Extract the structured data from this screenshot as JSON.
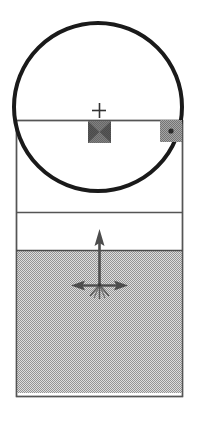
{
  "viewport": {
    "name": "CAD Sketch Viewport",
    "width": 206,
    "height": 443,
    "background_color": "#ffffff"
  },
  "colors": {
    "outline": "#1a1a1a",
    "edge_line": "#555555",
    "fill_grey": "#b3b3b3",
    "fill_white": "#ffffff",
    "handle_grey": "#808080",
    "gizmo": "#4d4d4d",
    "marker": "#333333"
  },
  "geometry": {
    "body_rect": {
      "label": "Extruded Body",
      "x": 16,
      "y": 120,
      "width": 167,
      "height": 277,
      "stroke": "#555555",
      "fill": "#ffffff"
    },
    "divider_lines": [
      {
        "label": "Upper Edge Line",
        "y": 212,
        "x1": 16,
        "x2": 183
      },
      {
        "label": "Material Boundary Line",
        "y": 250,
        "x1": 16,
        "x2": 183
      }
    ],
    "shaded_region": {
      "label": "Shaded Lower Face",
      "x": 16,
      "y": 250,
      "width": 167,
      "height": 147,
      "fill": "#b3b3b3"
    },
    "circle": {
      "label": "Sketch Circle",
      "cx": 98,
      "cy": 107,
      "r": 84,
      "stroke": "#1a1a1a",
      "stroke_width": 4,
      "fill": "none"
    },
    "center_marker": {
      "label": "Center Point Marker",
      "glyph": "+",
      "cx": 99,
      "cy": 110,
      "size": 15
    },
    "handles": [
      {
        "id": "center-handle",
        "label": "Center Drag Handle",
        "x": 88,
        "y": 121,
        "width": 23,
        "height": 22,
        "pattern": "hatched-x"
      },
      {
        "id": "radius-handle",
        "label": "Radius Drag Handle",
        "x": 160,
        "y": 120,
        "width": 22,
        "height": 22,
        "pattern": "dot-center"
      }
    ],
    "gizmo": {
      "label": "Three Axis Manipulator",
      "origin_x": 99,
      "origin_y": 285,
      "axes": [
        {
          "name": "y-axis-arrow",
          "direction": "up",
          "tip_x": 99,
          "tip_y": 231
        },
        {
          "name": "x-axis-arrow-left",
          "direction": "left",
          "tip_x": 71,
          "tip_y": 285
        },
        {
          "name": "x-axis-arrow-right",
          "direction": "right",
          "tip_x": 128,
          "tip_y": 285
        },
        {
          "name": "z-axis-tick-a",
          "direction": "down-left",
          "tip_x": 88,
          "tip_y": 297
        },
        {
          "name": "z-axis-tick-b",
          "direction": "down-right",
          "tip_x": 110,
          "tip_y": 297
        },
        {
          "name": "z-axis-tick-c",
          "direction": "down",
          "tip_x": 99,
          "tip_y": 299
        }
      ]
    }
  },
  "annotations": {
    "circle_name": "Sketch Circle",
    "body_name": "Extruded Body",
    "gizmo_name": "Three Axis Manipulator",
    "center_marker_name": "Center Point Marker"
  }
}
